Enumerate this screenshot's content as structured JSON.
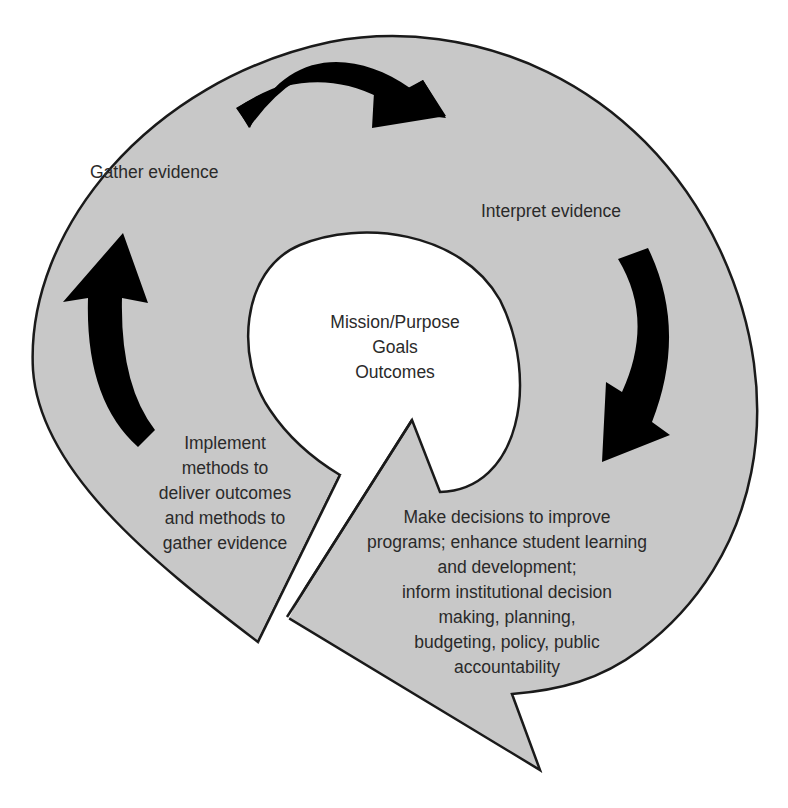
{
  "diagram": {
    "type": "cycle",
    "colors": {
      "ring_fill": "#c8c8c8",
      "center_fill": "#ffffff",
      "arrow_fill": "#000000",
      "outline": "#1a1a1a",
      "text": "#2a2a2a"
    },
    "center": {
      "lines": [
        "Mission/Purpose",
        "Goals",
        "Outcomes"
      ]
    },
    "steps": [
      {
        "id": "gather",
        "lines": [
          "Gather evidence"
        ]
      },
      {
        "id": "interpret",
        "lines": [
          "Interpret evidence"
        ]
      },
      {
        "id": "decide",
        "lines": [
          "Make decisions to improve",
          "programs; enhance student learning",
          "and development;",
          "inform institutional decision",
          "making, planning,",
          "budgeting, policy, public",
          "accountability"
        ]
      },
      {
        "id": "implement",
        "lines": [
          "Implement",
          "methods to",
          "deliver outcomes",
          "and methods to",
          "gather evidence"
        ]
      }
    ],
    "arrows": [
      {
        "from": "gather",
        "to": "interpret",
        "direction": "clockwise"
      },
      {
        "from": "interpret",
        "to": "decide",
        "direction": "clockwise"
      },
      {
        "from": "implement",
        "to": "gather",
        "direction": "clockwise"
      }
    ]
  }
}
